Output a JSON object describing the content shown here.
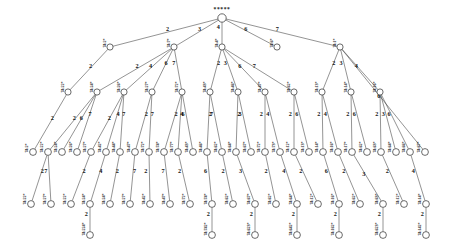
{
  "diagram": {
    "type": "tree",
    "title": "",
    "root_label": "*****",
    "node_radius": 3.1,
    "leaf_node_radius": 3.4,
    "edge_color": "#3a3a3a",
    "node_fill": "#ffffff",
    "node_stroke": "#2b2b2b",
    "label_rotation_deg": -90,
    "levels": 6,
    "nodes": [
      {
        "id": "r",
        "label": "*****",
        "x": 222,
        "y": 18,
        "level": 0,
        "label_kind": "root"
      },
      {
        "id": "n2a",
        "label": "74:2*",
        "x": 110,
        "y": 47,
        "level": 1
      },
      {
        "id": "n2b",
        "label": "74:7*",
        "x": 174,
        "y": 47,
        "level": 1
      },
      {
        "id": "n2c",
        "label": "74:4*",
        "x": 222,
        "y": 47,
        "level": 1
      },
      {
        "id": "n2d",
        "label": "74:6*",
        "x": 277,
        "y": 47,
        "level": 1
      },
      {
        "id": "n2e",
        "label": "74:1*",
        "x": 340,
        "y": 47,
        "level": 1
      },
      {
        "id": "n3a",
        "label": "74:22*",
        "x": 68,
        "y": 92,
        "level": 2
      },
      {
        "id": "n3b",
        "label": "74:24*",
        "x": 97,
        "y": 92,
        "level": 2
      },
      {
        "id": "n3c",
        "label": "74:26*",
        "x": 124,
        "y": 92,
        "level": 2
      },
      {
        "id": "n3d",
        "label": "74:27*",
        "x": 152,
        "y": 92,
        "level": 2
      },
      {
        "id": "n3e",
        "label": "74:72*",
        "x": 182,
        "y": 92,
        "level": 2
      },
      {
        "id": "n3f",
        "label": "74:43*",
        "x": 210,
        "y": 92,
        "level": 2
      },
      {
        "id": "n3g",
        "label": "74:46*",
        "x": 238,
        "y": 92,
        "level": 2
      },
      {
        "id": "n3h",
        "label": "74:47*",
        "x": 265,
        "y": 92,
        "level": 2
      },
      {
        "id": "n3i",
        "label": "74:62*",
        "x": 294,
        "y": 92,
        "level": 2
      },
      {
        "id": "n3j",
        "label": "74:13*",
        "x": 322,
        "y": 92,
        "level": 2
      },
      {
        "id": "n3k",
        "label": "74:14*",
        "x": 351,
        "y": 92,
        "level": 2
      },
      {
        "id": "n3l",
        "label": "74:16*",
        "x": 380,
        "y": 92,
        "level": 2
      },
      {
        "id": "n4a",
        "label": "74:2*",
        "x": 33,
        "y": 152,
        "level": 3
      },
      {
        "id": "n4b",
        "label": "74:22*",
        "x": 48,
        "y": 152,
        "level": 3
      },
      {
        "id": "n4c",
        "label": "74:24*",
        "x": 62,
        "y": 152,
        "level": 3
      },
      {
        "id": "n4d",
        "label": "74:26*",
        "x": 77,
        "y": 152,
        "level": 3
      },
      {
        "id": "n4e",
        "label": "74:27*",
        "x": 91,
        "y": 152,
        "level": 3
      },
      {
        "id": "n4f",
        "label": "74:42*",
        "x": 106,
        "y": 152,
        "level": 3
      },
      {
        "id": "n4g",
        "label": "74:44*",
        "x": 120,
        "y": 152,
        "level": 3
      },
      {
        "id": "n4h",
        "label": "74:47*",
        "x": 135,
        "y": 152,
        "level": 3
      },
      {
        "id": "n4i",
        "label": "74:72*",
        "x": 149,
        "y": 152,
        "level": 3
      },
      {
        "id": "n4j",
        "label": "74:74*",
        "x": 164,
        "y": 152,
        "level": 3
      },
      {
        "id": "n4k",
        "label": "74:77*",
        "x": 178,
        "y": 152,
        "level": 3
      },
      {
        "id": "n4l",
        "label": "74:43*",
        "x": 193,
        "y": 152,
        "level": 3
      },
      {
        "id": "n4m",
        "label": "74:46*",
        "x": 207,
        "y": 152,
        "level": 3
      },
      {
        "id": "n4n",
        "label": "74:62*",
        "x": 222,
        "y": 152,
        "level": 3
      },
      {
        "id": "n4o",
        "label": "74:64*",
        "x": 236,
        "y": 152,
        "level": 3
      },
      {
        "id": "n4p",
        "label": "74:67*",
        "x": 251,
        "y": 152,
        "level": 3
      },
      {
        "id": "n4q",
        "label": "74:72*",
        "x": 265,
        "y": 152,
        "level": 3
      },
      {
        "id": "n4r",
        "label": "74:73*",
        "x": 280,
        "y": 152,
        "level": 3
      },
      {
        "id": "n4s",
        "label": "74:12*",
        "x": 294,
        "y": 152,
        "level": 3
      },
      {
        "id": "n4t",
        "label": "74:13*",
        "x": 309,
        "y": 152,
        "level": 3
      },
      {
        "id": "n4u",
        "label": "74:14*",
        "x": 323,
        "y": 152,
        "level": 3
      },
      {
        "id": "n4v",
        "label": "74:16*",
        "x": 338,
        "y": 152,
        "level": 3
      },
      {
        "id": "n4w",
        "label": "74:17*",
        "x": 352,
        "y": 152,
        "level": 3
      },
      {
        "id": "n4x",
        "label": "74:62*",
        "x": 367,
        "y": 152,
        "level": 3
      },
      {
        "id": "n4y",
        "label": "74:63*",
        "x": 381,
        "y": 152,
        "level": 3
      },
      {
        "id": "n4z",
        "label": "74:64*",
        "x": 396,
        "y": 152,
        "level": 3
      },
      {
        "id": "n4aa",
        "label": "74:66*",
        "x": 410,
        "y": 152,
        "level": 3
      },
      {
        "id": "n4ab",
        "label": "74:67*",
        "x": 425,
        "y": 152,
        "level": 3
      },
      {
        "id": "l1",
        "label": "74:22*",
        "x": 31,
        "y": 204,
        "level": 4
      },
      {
        "id": "l2",
        "label": "74:27*",
        "x": 51,
        "y": 204,
        "level": 4
      },
      {
        "id": "l3",
        "label": "74:22*",
        "x": 71,
        "y": 204,
        "level": 4
      },
      {
        "id": "l4",
        "label": "74:24*",
        "x": 90,
        "y": 204,
        "level": 4
      },
      {
        "id": "l5",
        "label": "74:24*",
        "x": 110,
        "y": 204,
        "level": 4
      },
      {
        "id": "l6",
        "label": "74:27*",
        "x": 130,
        "y": 204,
        "level": 4
      },
      {
        "id": "l7",
        "label": "74:42*",
        "x": 150,
        "y": 204,
        "level": 4
      },
      {
        "id": "l8",
        "label": "74:47*",
        "x": 170,
        "y": 204,
        "level": 4
      },
      {
        "id": "l9",
        "label": "74:72*",
        "x": 190,
        "y": 204,
        "level": 4
      },
      {
        "id": "l10",
        "label": "74:74*",
        "x": 212,
        "y": 204,
        "level": 4
      },
      {
        "id": "l11",
        "label": "74:62*",
        "x": 233,
        "y": 204,
        "level": 4
      },
      {
        "id": "l12",
        "label": "74:67*",
        "x": 255,
        "y": 204,
        "level": 4
      },
      {
        "id": "l13",
        "label": "74:62*",
        "x": 276,
        "y": 204,
        "level": 4
      },
      {
        "id": "l14",
        "label": "74:64*",
        "x": 297,
        "y": 204,
        "level": 4
      },
      {
        "id": "l15",
        "label": "74:12*",
        "x": 318,
        "y": 204,
        "level": 4
      },
      {
        "id": "l16",
        "label": "74:16*",
        "x": 339,
        "y": 204,
        "level": 4
      },
      {
        "id": "l17",
        "label": "74:62*",
        "x": 360,
        "y": 204,
        "level": 4
      },
      {
        "id": "l18",
        "label": "74:63*",
        "x": 383,
        "y": 204,
        "level": 4
      },
      {
        "id": "l19",
        "label": "74:12*",
        "x": 404,
        "y": 204,
        "level": 4
      },
      {
        "id": "l20",
        "label": "74:14*",
        "x": 426,
        "y": 204,
        "level": 4
      },
      {
        "id": "m1",
        "label": "74:224*",
        "x": 90,
        "y": 235,
        "level": 5
      },
      {
        "id": "m2",
        "label": "74:742*",
        "x": 212,
        "y": 235,
        "level": 5
      },
      {
        "id": "m3",
        "label": "74:623*",
        "x": 255,
        "y": 235,
        "level": 5
      },
      {
        "id": "m4",
        "label": "74:642*",
        "x": 297,
        "y": 235,
        "level": 5
      },
      {
        "id": "m5",
        "label": "74:162*",
        "x": 339,
        "y": 235,
        "level": 5
      },
      {
        "id": "m6",
        "label": "74:623*",
        "x": 383,
        "y": 235,
        "level": 5
      },
      {
        "id": "m7",
        "label": "74:142*",
        "x": 426,
        "y": 235,
        "level": 5
      }
    ],
    "edges": [
      {
        "from": "r",
        "to": "n2a",
        "label": "2"
      },
      {
        "from": "r",
        "to": "n2b",
        "label": "3"
      },
      {
        "from": "r",
        "to": "n2c",
        "label": "4"
      },
      {
        "from": "r",
        "to": "n2d",
        "label": "6"
      },
      {
        "from": "r",
        "to": "n2e",
        "label": "7"
      },
      {
        "from": "n2a",
        "to": "n3a",
        "label": "2"
      },
      {
        "from": "n2b",
        "to": "n3b",
        "label": "2"
      },
      {
        "from": "n2b",
        "to": "n3c",
        "label": "4"
      },
      {
        "from": "n2b",
        "to": "n3d",
        "label": "6"
      },
      {
        "from": "n2b",
        "to": "n3e",
        "label": "7"
      },
      {
        "from": "n2c",
        "to": "n3f",
        "label": "2"
      },
      {
        "from": "n2c",
        "to": "n3g",
        "label": "3"
      },
      {
        "from": "n2c",
        "to": "n3h",
        "label": "6"
      },
      {
        "from": "n2c",
        "to": "n3i",
        "label": "7"
      },
      {
        "from": "n2e",
        "to": "n3j",
        "label": "2"
      },
      {
        "from": "n2e",
        "to": "n3k",
        "label": "3"
      },
      {
        "from": "n2e",
        "to": "n3l",
        "label": "4"
      },
      {
        "from": "n2e",
        "to": "n4ab",
        "label": "6"
      },
      {
        "from": "n3a",
        "to": "n4a",
        "label": "2"
      },
      {
        "from": "n3b",
        "to": "n4b",
        "label": "2"
      },
      {
        "from": "n3b",
        "to": "n4c",
        "label": "6"
      },
      {
        "from": "n3b",
        "to": "n4d",
        "label": "7"
      },
      {
        "from": "n3c",
        "to": "n4e",
        "label": "2"
      },
      {
        "from": "n3c",
        "to": "n4f",
        "label": "4"
      },
      {
        "from": "n3c",
        "to": "n4g",
        "label": "7"
      },
      {
        "from": "n3d",
        "to": "n4h",
        "label": "2"
      },
      {
        "from": "n3d",
        "to": "n4i",
        "label": "7"
      },
      {
        "from": "n3e",
        "to": "n4j",
        "label": "2"
      },
      {
        "from": "n3e",
        "to": "n4k",
        "label": "4"
      },
      {
        "from": "n3e",
        "to": "n4l",
        "label": "6"
      },
      {
        "from": "n3f",
        "to": "n4m",
        "label": "2"
      },
      {
        "from": "n3f",
        "to": "n4n",
        "label": "7"
      },
      {
        "from": "n3g",
        "to": "n4o",
        "label": "2"
      },
      {
        "from": "n3g",
        "to": "n4p",
        "label": "3"
      },
      {
        "from": "n3h",
        "to": "n4q",
        "label": "2"
      },
      {
        "from": "n3h",
        "to": "n4r",
        "label": "4"
      },
      {
        "from": "n3i",
        "to": "n4s",
        "label": "2"
      },
      {
        "from": "n3i",
        "to": "n4t",
        "label": "6"
      },
      {
        "from": "n3j",
        "to": "n4u",
        "label": "2"
      },
      {
        "from": "n3j",
        "to": "n4v",
        "label": "4"
      },
      {
        "from": "n3k",
        "to": "n4w",
        "label": "2"
      },
      {
        "from": "n3k",
        "to": "n4x",
        "label": "6"
      },
      {
        "from": "n3l",
        "to": "n4y",
        "label": "2"
      },
      {
        "from": "n3l",
        "to": "n4z",
        "label": "3"
      },
      {
        "from": "n3l",
        "to": "n4aa",
        "label": "6"
      },
      {
        "from": "n4b",
        "to": "l1",
        "label": "2"
      },
      {
        "from": "n4b",
        "to": "l2",
        "label": "7"
      },
      {
        "from": "n4e",
        "to": "l3",
        "label": "2"
      },
      {
        "from": "n4f",
        "to": "l4",
        "label": "4"
      },
      {
        "from": "n4g",
        "to": "l5",
        "label": "2"
      },
      {
        "from": "n4h",
        "to": "l6",
        "label": "7"
      },
      {
        "from": "n4i",
        "to": "l7",
        "label": "2"
      },
      {
        "from": "n4j",
        "to": "l8",
        "label": "7"
      },
      {
        "from": "n4k",
        "to": "l9",
        "label": "2"
      },
      {
        "from": "n4m",
        "to": "l10",
        "label": "6"
      },
      {
        "from": "n4n",
        "to": "l11",
        "label": "2"
      },
      {
        "from": "n4o",
        "to": "l12",
        "label": "3"
      },
      {
        "from": "n4q",
        "to": "l13",
        "label": "2"
      },
      {
        "from": "n4r",
        "to": "l14",
        "label": "4"
      },
      {
        "from": "n4s",
        "to": "l15",
        "label": "2"
      },
      {
        "from": "n4u",
        "to": "l16",
        "label": "6"
      },
      {
        "from": "n4v",
        "to": "l17",
        "label": "2"
      },
      {
        "from": "n4w",
        "to": "l18",
        "label": "3"
      },
      {
        "from": "n4y",
        "to": "l19",
        "label": "2"
      },
      {
        "from": "n4aa",
        "to": "l20",
        "label": "4"
      },
      {
        "from": "l4",
        "to": "m1",
        "label": "2"
      },
      {
        "from": "l10",
        "to": "m2",
        "label": "2"
      },
      {
        "from": "l12",
        "to": "m3",
        "label": "2"
      },
      {
        "from": "l14",
        "to": "m4",
        "label": "2"
      },
      {
        "from": "l16",
        "to": "m5",
        "label": "2"
      },
      {
        "from": "l18",
        "to": "m6",
        "label": "2"
      },
      {
        "from": "l20",
        "to": "m7",
        "label": "2"
      }
    ]
  }
}
